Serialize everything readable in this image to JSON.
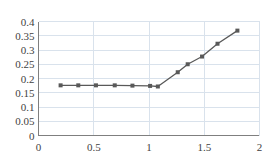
{
  "chart_data": {
    "type": "line",
    "title": "",
    "xlabel": "",
    "ylabel": "",
    "xlim": [
      0,
      2
    ],
    "ylim": [
      0,
      0.4
    ],
    "grid": true,
    "legend": null,
    "xticks": [
      "0",
      "0.5",
      "1",
      "1.5",
      "2"
    ],
    "xtick_values": [
      0,
      0.5,
      1,
      1.5,
      2
    ],
    "yticks": [
      "0",
      "0.05",
      "0.1",
      "0.15",
      "0.2",
      "0.25",
      "0.3",
      "0.35",
      "0.4"
    ],
    "ytick_values": [
      0,
      0.05,
      0.1,
      0.15,
      0.2,
      0.25,
      0.3,
      0.35,
      0.4
    ],
    "series": [
      {
        "name": "series-1",
        "color": "#595959",
        "marker": "square",
        "x": [
          0.2,
          0.36,
          0.52,
          0.69,
          0.85,
          1.01,
          1.08,
          1.26,
          1.35,
          1.48,
          1.62,
          1.8
        ],
        "y": [
          0.176,
          0.176,
          0.176,
          0.176,
          0.175,
          0.174,
          0.172,
          0.222,
          0.25,
          0.277,
          0.322,
          0.368
        ]
      }
    ]
  },
  "axes": {
    "line_color": "#7f7f7f",
    "grid_color": "#d9e2ec",
    "tick_color": "#3f3f3f"
  }
}
